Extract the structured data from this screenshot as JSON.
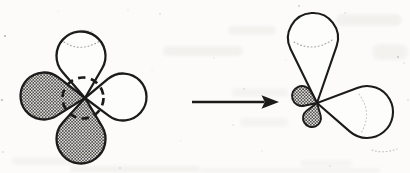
{
  "figure_meta": {
    "kind": "textbook-orbital-hybridization-diagram",
    "left_label": "four-orbital-lobes-with-dashed-s-orbital",
    "right_label": "hybrid-orbital-result",
    "arrow_label": "transforms-into-arrow"
  },
  "diagram": {
    "width": 410,
    "height": 173,
    "background": "#fcfbf9",
    "ink": "#1b1b1b",
    "lobe_plain_fill": "#fdfdfb",
    "dotted_arc_color": "#8f8d88",
    "smudge_color": "#8a867e",
    "speckle_color": "#6f6c66",
    "stipple": {
      "cell": 3.1,
      "dot_r": 0.88,
      "dot_color": "#3e3e3e",
      "bg": "#e7e5e0"
    },
    "figures": [
      {
        "name": "unhybridized-orbitals",
        "tip": [
          85,
          98
        ],
        "lobes": [
          {
            "name": "orbital-lobe-left-shaded",
            "center": [
              44,
              96
            ],
            "r": 23.5,
            "fill": "stipple",
            "sw": 2.3
          },
          {
            "name": "orbital-lobe-bottom-shaded",
            "center": [
              81,
              139
            ],
            "r": 24.5,
            "fill": "stipple",
            "sw": 2.3
          },
          {
            "name": "orbital-lobe-top-white",
            "center": [
              81,
              56
            ],
            "r": 24.5,
            "fill": "plain",
            "sw": 2.3
          },
          {
            "name": "orbital-lobe-right-white",
            "center": [
              123,
              97
            ],
            "r": 23.5,
            "fill": "plain",
            "sw": 2.3
          }
        ],
        "dashed_circle": {
          "name": "s-orbital-dashed-circle",
          "center": [
            83,
            98
          ],
          "r": 20.5,
          "sw": 2.7,
          "dash": "7.5 5.5"
        },
        "dotted_arcs": [
          {
            "d": "M 64 42 Q 80 53 100 41",
            "o": 0.85
          },
          {
            "d": "M 70 33 Q 81 28 94 32",
            "o": 0.4
          }
        ]
      },
      {
        "name": "hybrid-orbital",
        "tip": [
          317,
          103
        ],
        "lobes": [
          {
            "name": "hybrid-lobe-large-up",
            "center": [
              313,
              38
            ],
            "r": 25,
            "fill": "plain",
            "sw": 2.1
          },
          {
            "name": "hybrid-lobe-large-right",
            "center": [
              367,
              112
            ],
            "r": 26,
            "fill": "plain",
            "sw": 2.1
          },
          {
            "name": "hybrid-lobe-small-left-shaded",
            "center": [
              302,
              96
            ],
            "r": 10,
            "fill": "stipple",
            "sw": 1.9
          },
          {
            "name": "hybrid-lobe-small-down-shaded",
            "center": [
              312,
              118
            ],
            "r": 9,
            "fill": "stipple",
            "sw": 1.9
          }
        ],
        "dashed_circle": null,
        "dotted_arcs": [
          {
            "d": "M 294 42 Q 313 53 332 40",
            "o": 0.8
          },
          {
            "d": "M 359 94 Q 373 113 361 133",
            "o": 0.5
          },
          {
            "d": "M 372 150 Q 383 154 397 149",
            "o": 0.55
          }
        ]
      }
    ],
    "arrow": {
      "name": "transformation-arrow",
      "x1": 192,
      "x2": 264.5,
      "y": 102,
      "sw": 2.7,
      "head": [
        [
          279,
          102
        ],
        [
          261.5,
          95.3
        ],
        [
          264.8,
          102
        ],
        [
          261.5,
          108.7
        ]
      ]
    },
    "speckles": [
      [
        5,
        36,
        1.0,
        0.5
      ],
      [
        2,
        100,
        1.1,
        0.45
      ],
      [
        3,
        152,
        0.8,
        0.35
      ],
      [
        160,
        14,
        0.8,
        0.3
      ],
      [
        299,
        6,
        0.9,
        0.35
      ],
      [
        345,
        13,
        0.7,
        0.3
      ],
      [
        398,
        57,
        1.0,
        0.35
      ],
      [
        404,
        63,
        0.7,
        0.3
      ],
      [
        128,
        10,
        0.6,
        0.25
      ],
      [
        214,
        58,
        0.7,
        0.22
      ],
      [
        233,
        125,
        0.7,
        0.25
      ],
      [
        181,
        141,
        0.6,
        0.2
      ],
      [
        262,
        151,
        0.7,
        0.2
      ],
      [
        330,
        166,
        0.7,
        0.25
      ],
      [
        120,
        168,
        0.8,
        0.3
      ],
      [
        58,
        11,
        0.6,
        0.2
      ],
      [
        244,
        89,
        0.8,
        0.3
      ],
      [
        408,
        100,
        0.8,
        0.3
      ],
      [
        152,
        70,
        0.6,
        0.18
      ],
      [
        286,
        60,
        0.6,
        0.18
      ]
    ],
    "smudges": [
      {
        "x": 228,
        "y": 26,
        "w": 48,
        "h": 9,
        "o": 0.07
      },
      {
        "x": 336,
        "y": 14,
        "w": 66,
        "h": 12,
        "o": 0.08
      },
      {
        "x": 372,
        "y": 44,
        "w": 36,
        "h": 16,
        "o": 0.07
      },
      {
        "x": 163,
        "y": 46,
        "w": 80,
        "h": 10,
        "o": 0.08
      },
      {
        "x": 232,
        "y": 88,
        "w": 56,
        "h": 9,
        "o": 0.06
      },
      {
        "x": 240,
        "y": 118,
        "w": 48,
        "h": 9,
        "o": 0.06
      },
      {
        "x": 12,
        "y": 157,
        "w": 66,
        "h": 8,
        "o": 0.06
      },
      {
        "x": 300,
        "y": 160,
        "w": 52,
        "h": 7,
        "o": 0.05
      },
      {
        "x": 70,
        "y": 166,
        "w": 130,
        "h": 6,
        "o": 0.08
      },
      {
        "x": 200,
        "y": 168,
        "w": 180,
        "h": 5,
        "o": 0.06
      }
    ]
  }
}
